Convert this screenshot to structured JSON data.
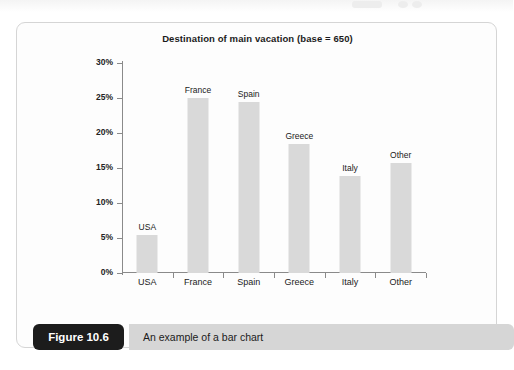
{
  "figure": {
    "badge_label": "Figure 10.6",
    "caption": "An example of a bar chart"
  },
  "colors": {
    "bar_fill": "#d9d9d9",
    "axis": "#8a8a8a",
    "card_bg": "#fdfdfd",
    "card_border": "#d5d5d5",
    "badge_bg": "#1c1c1c",
    "caption_bg": "#d6d6d6",
    "text": "#1b1b1b"
  },
  "chart_data": {
    "type": "bar",
    "title": "Destination of main vacation (base = 650)",
    "xlabel": "",
    "ylabel": "",
    "categories": [
      "USA",
      "France",
      "Spain",
      "Greece",
      "Italy",
      "Other"
    ],
    "values": [
      5.5,
      25.0,
      24.5,
      18.5,
      13.8,
      15.7
    ],
    "point_labels": [
      "USA",
      "France",
      "Spain",
      "Greece",
      "Italy",
      "Other"
    ],
    "ylim": [
      0,
      30
    ],
    "ytick_values": [
      0,
      5,
      10,
      15,
      20,
      25,
      30
    ],
    "ytick_labels": [
      "0%",
      "5%",
      "10%",
      "15%",
      "20%",
      "25%",
      "30%"
    ],
    "grid": false,
    "legend": null,
    "legend_position": "none",
    "base": 650
  }
}
